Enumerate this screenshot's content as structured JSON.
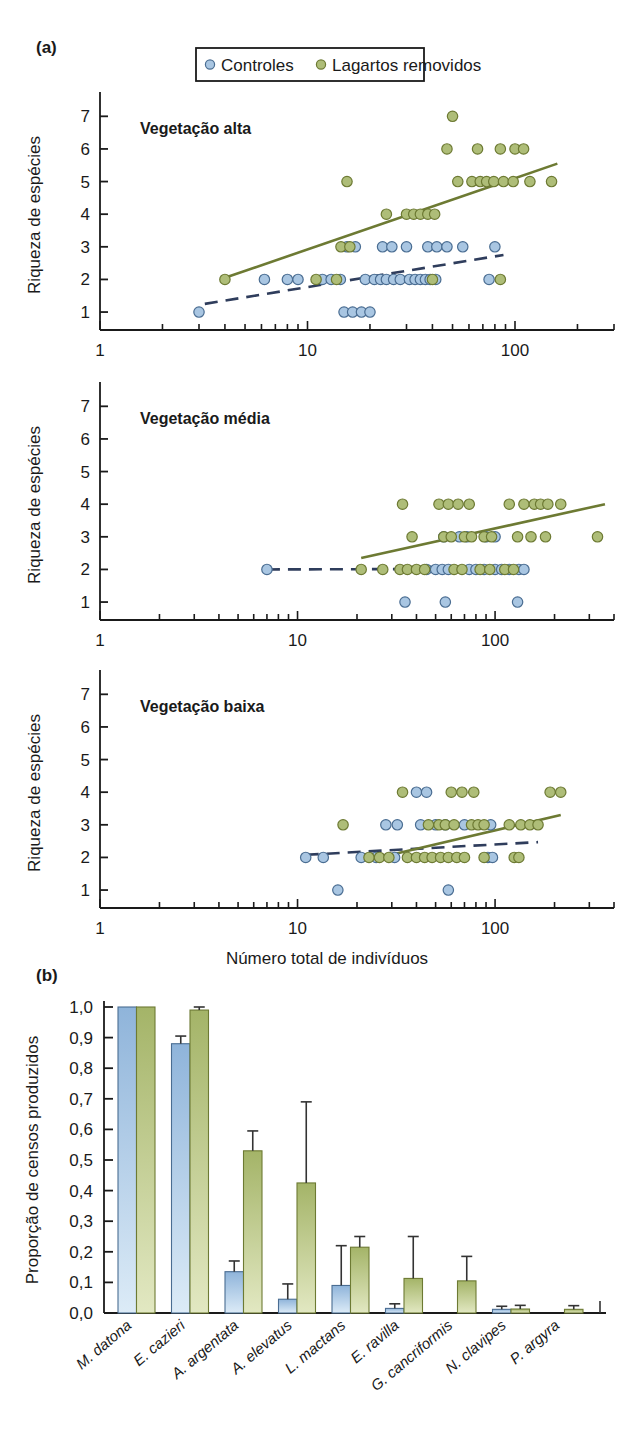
{
  "figure": {
    "panel_a_tag": "(a)",
    "panel_b_tag": "(b)"
  },
  "legend": {
    "items": [
      {
        "label": "Controles",
        "color": "#a9c6e2",
        "icon": "circle-marker-icon"
      },
      {
        "label": "Lagartos removidos",
        "color": "#aebd78",
        "icon": "circle-marker-icon"
      }
    ]
  },
  "colors": {
    "control_fill": "#a9c6e2",
    "control_stroke": "#4a6d92",
    "removed_fill": "#aebd78",
    "removed_stroke": "#6d7a33",
    "control_line": "#2f3d5c",
    "removed_line": "#6d7a33",
    "axis": "#1a1a1a",
    "bar_blue_top": "#8fb4da",
    "bar_blue_bottom": "#dbe9f6",
    "bar_green_top": "#a4b468",
    "bar_green_bottom": "#dfe6bf"
  },
  "chart_data": [
    {
      "type": "scatter",
      "id": "vegetacao-alta",
      "title": "Vegetação alta",
      "xlabel": "",
      "ylabel": "Riqueza de espécies",
      "xscale": "log",
      "xlim": [
        1,
        300
      ],
      "ylim": [
        0.45,
        7.5
      ],
      "xticks": [
        1,
        10,
        100
      ],
      "xticklabels": [
        "1",
        "10",
        "100"
      ],
      "yticks": [
        1,
        2,
        3,
        4,
        5,
        6,
        7
      ],
      "yticklabels": [
        "1",
        "2",
        "3",
        "4",
        "5",
        "6",
        "7"
      ],
      "grid": false,
      "series": [
        {
          "name": "Controles",
          "marker": "circle",
          "color": "#a9c6e2",
          "points": [
            [
              3.0,
              1
            ],
            [
              15.0,
              1
            ],
            [
              16.5,
              1
            ],
            [
              18.2,
              1
            ],
            [
              20.0,
              1
            ],
            [
              6.2,
              2
            ],
            [
              8.0,
              2
            ],
            [
              9.0,
              2
            ],
            [
              11.8,
              2
            ],
            [
              13.0,
              2
            ],
            [
              14.4,
              2
            ],
            [
              19.0,
              2
            ],
            [
              21.0,
              2
            ],
            [
              22.5,
              2
            ],
            [
              24.0,
              2
            ],
            [
              26.0,
              2
            ],
            [
              28.0,
              2
            ],
            [
              31.0,
              2
            ],
            [
              33.0,
              2
            ],
            [
              35.0,
              2
            ],
            [
              37.0,
              2
            ],
            [
              39.0,
              2
            ],
            [
              41.5,
              2
            ],
            [
              75.0,
              2
            ],
            [
              15.5,
              3
            ],
            [
              17.0,
              3
            ],
            [
              23.0,
              3
            ],
            [
              25.5,
              3
            ],
            [
              30.0,
              3
            ],
            [
              38.0,
              3
            ],
            [
              42.0,
              3
            ],
            [
              47.0,
              3
            ],
            [
              56.0,
              3
            ],
            [
              80.0,
              3
            ]
          ]
        },
        {
          "name": "Lagartos removidos",
          "marker": "circle",
          "color": "#aebd78",
          "points": [
            [
              4.0,
              2
            ],
            [
              11.0,
              2
            ],
            [
              13.8,
              2
            ],
            [
              40.0,
              2
            ],
            [
              85.0,
              2
            ],
            [
              14.5,
              3
            ],
            [
              16.0,
              3
            ],
            [
              24.0,
              4
            ],
            [
              30.0,
              4
            ],
            [
              32.5,
              4
            ],
            [
              35.0,
              4
            ],
            [
              38.0,
              4
            ],
            [
              41.0,
              4
            ],
            [
              15.5,
              5
            ],
            [
              53.0,
              5
            ],
            [
              62.0,
              5
            ],
            [
              68.0,
              5
            ],
            [
              73.0,
              5
            ],
            [
              79.0,
              5
            ],
            [
              88.0,
              5
            ],
            [
              98.0,
              5
            ],
            [
              118.0,
              5
            ],
            [
              150.0,
              5
            ],
            [
              47.0,
              6
            ],
            [
              66.0,
              6
            ],
            [
              85.0,
              6
            ],
            [
              100.0,
              6
            ],
            [
              110.0,
              6
            ],
            [
              50.0,
              7
            ]
          ]
        }
      ],
      "trendlines": [
        {
          "name": "Controles",
          "style": "dashed",
          "color": "#2f3d5c",
          "x1": 3.2,
          "y1": 1.25,
          "x2": 88.0,
          "y2": 2.75
        },
        {
          "name": "Lagartos removidos",
          "style": "solid",
          "color": "#6d7a33",
          "x1": 4.0,
          "y1": 2.05,
          "x2": 160.0,
          "y2": 5.55
        }
      ]
    },
    {
      "type": "scatter",
      "id": "vegetacao-media",
      "title": "Vegetação média",
      "xlabel": "",
      "ylabel": "Riqueza de espécies",
      "xscale": "log",
      "xlim": [
        1,
        400
      ],
      "ylim": [
        0.45,
        7.5
      ],
      "xticks": [
        1,
        10,
        100
      ],
      "xticklabels": [
        "1",
        "10",
        "100"
      ],
      "yticks": [
        1,
        2,
        3,
        4,
        5,
        6,
        7
      ],
      "yticklabels": [
        "1",
        "2",
        "3",
        "4",
        "5",
        "6",
        "7"
      ],
      "grid": false,
      "series": [
        {
          "name": "Controles",
          "marker": "circle",
          "color": "#a9c6e2",
          "points": [
            [
              35.0,
              1
            ],
            [
              56.0,
              1
            ],
            [
              130.0,
              1
            ],
            [
              7.0,
              2
            ],
            [
              45.0,
              2
            ],
            [
              50.0,
              2
            ],
            [
              54.0,
              2
            ],
            [
              58.0,
              2
            ],
            [
              74.0,
              2
            ],
            [
              80.0,
              2
            ],
            [
              88.0,
              2
            ],
            [
              100.0,
              2
            ],
            [
              108.0,
              2
            ],
            [
              118.0,
              2
            ],
            [
              132.0,
              2
            ],
            [
              140.0,
              2
            ],
            [
              55.0,
              3
            ],
            [
              66.0,
              3
            ],
            [
              72.0,
              3
            ],
            [
              90.0,
              3
            ],
            [
              100.0,
              3
            ]
          ]
        },
        {
          "name": "Lagartos removidos",
          "marker": "circle",
          "color": "#aebd78",
          "points": [
            [
              21.0,
              2
            ],
            [
              27.0,
              2
            ],
            [
              33.0,
              2
            ],
            [
              36.0,
              2
            ],
            [
              40.0,
              2
            ],
            [
              44.0,
              2
            ],
            [
              62.0,
              2
            ],
            [
              68.0,
              2
            ],
            [
              84.0,
              2
            ],
            [
              94.0,
              2
            ],
            [
              112.0,
              2
            ],
            [
              124.0,
              2
            ],
            [
              38.0,
              3
            ],
            [
              55.0,
              3
            ],
            [
              60.0,
              3
            ],
            [
              70.0,
              3
            ],
            [
              76.0,
              3
            ],
            [
              88.0,
              3
            ],
            [
              96.0,
              3
            ],
            [
              130.0,
              3
            ],
            [
              152.0,
              3
            ],
            [
              180.0,
              3
            ],
            [
              330.0,
              3
            ],
            [
              34.0,
              4
            ],
            [
              52.0,
              4
            ],
            [
              58.0,
              4
            ],
            [
              65.0,
              4
            ],
            [
              74.0,
              4
            ],
            [
              118.0,
              4
            ],
            [
              140.0,
              4
            ],
            [
              158.0,
              4
            ],
            [
              170.0,
              4
            ],
            [
              185.0,
              4
            ],
            [
              215.0,
              4
            ]
          ]
        }
      ],
      "trendlines": [
        {
          "name": "Controles",
          "style": "dashed",
          "color": "#2f3d5c",
          "x1": 7.0,
          "y1": 2.0,
          "x2": 140.0,
          "y2": 2.02
        },
        {
          "name": "Lagartos removidos",
          "style": "solid",
          "color": "#6d7a33",
          "x1": 21.0,
          "y1": 2.35,
          "x2": 360.0,
          "y2": 4.0
        }
      ]
    },
    {
      "type": "scatter",
      "id": "vegetacao-baixa",
      "title": "Vegetação baixa",
      "xlabel": "Número total de indivíduos",
      "ylabel": "Riqueza de espécies",
      "xscale": "log",
      "xlim": [
        1,
        400
      ],
      "ylim": [
        0.45,
        7.5
      ],
      "xticks": [
        1,
        10,
        100
      ],
      "xticklabels": [
        "1",
        "10",
        "100"
      ],
      "yticks": [
        1,
        2,
        3,
        4,
        5,
        6,
        7
      ],
      "yticklabels": [
        "1",
        "2",
        "3",
        "4",
        "5",
        "6",
        "7"
      ],
      "grid": false,
      "series": [
        {
          "name": "Controles",
          "marker": "circle",
          "color": "#a9c6e2",
          "points": [
            [
              16.0,
              1
            ],
            [
              58.0,
              1
            ],
            [
              11.0,
              2
            ],
            [
              13.5,
              2
            ],
            [
              21.0,
              2
            ],
            [
              25.0,
              2
            ],
            [
              31.0,
              2
            ],
            [
              92.0,
              2
            ],
            [
              97.0,
              2
            ],
            [
              28.0,
              3
            ],
            [
              32.0,
              3
            ],
            [
              42.0,
              3
            ],
            [
              50.0,
              3
            ],
            [
              56.0,
              3
            ],
            [
              70.0,
              3
            ],
            [
              95.0,
              3
            ],
            [
              40.0,
              4
            ],
            [
              45.0,
              4
            ]
          ]
        },
        {
          "name": "Lagartos removidos",
          "marker": "circle",
          "color": "#aebd78",
          "points": [
            [
              23.0,
              2
            ],
            [
              26.0,
              2
            ],
            [
              29.0,
              2
            ],
            [
              36.0,
              2
            ],
            [
              40.0,
              2
            ],
            [
              44.0,
              2
            ],
            [
              48.0,
              2
            ],
            [
              53.0,
              2
            ],
            [
              58.0,
              2
            ],
            [
              64.0,
              2
            ],
            [
              70.0,
              2
            ],
            [
              88.0,
              2
            ],
            [
              125.0,
              2
            ],
            [
              132.0,
              2
            ],
            [
              17.0,
              3
            ],
            [
              46.0,
              3
            ],
            [
              52.0,
              3
            ],
            [
              56.0,
              3
            ],
            [
              62.0,
              3
            ],
            [
              76.0,
              3
            ],
            [
              82.0,
              3
            ],
            [
              88.0,
              3
            ],
            [
              118.0,
              3
            ],
            [
              135.0,
              3
            ],
            [
              150.0,
              3
            ],
            [
              165.0,
              3
            ],
            [
              34.0,
              4
            ],
            [
              60.0,
              4
            ],
            [
              68.0,
              4
            ],
            [
              78.0,
              4
            ],
            [
              190.0,
              4
            ],
            [
              215.0,
              4
            ]
          ]
        }
      ],
      "trendlines": [
        {
          "name": "Controles",
          "style": "dashed",
          "color": "#2f3d5c",
          "x1": 11.0,
          "y1": 2.08,
          "x2": 165.0,
          "y2": 2.47
        },
        {
          "name": "Lagartos removidos",
          "style": "solid",
          "color": "#6d7a33",
          "x1": 26.0,
          "y1": 2.0,
          "x2": 215.0,
          "y2": 3.3
        }
      ]
    },
    {
      "type": "bar",
      "id": "proporcao-censos",
      "title": "",
      "xlabel": "",
      "ylabel": "Proporção de censos produzidos",
      "ylim": [
        0.0,
        1.0
      ],
      "yticks": [
        0.0,
        0.1,
        0.2,
        0.3,
        0.4,
        0.5,
        0.6,
        0.7,
        0.8,
        0.9,
        1.0
      ],
      "yticklabels": [
        "0,0",
        "0,1",
        "0,2",
        "0,3",
        "0,4",
        "0,5",
        "0,6",
        "0,7",
        "0,8",
        "0,9",
        "1,0"
      ],
      "grid": false,
      "categories": [
        "M. datona",
        "E. cazieri",
        "A. argentata",
        "A. elevatus",
        "L. mactans",
        "E. ravilla",
        "G. cancriformis",
        "N. clavipes",
        "P. argyra"
      ],
      "series": [
        {
          "name": "Controles",
          "color": "#a9c6e2",
          "values": [
            1.0,
            0.88,
            0.135,
            0.045,
            0.09,
            0.015,
            0.0,
            0.012,
            0.0
          ],
          "errors": [
            0.0,
            0.025,
            0.035,
            0.05,
            0.13,
            0.015,
            0.0,
            0.01,
            0.0
          ]
        },
        {
          "name": "Lagartos removidos",
          "color": "#aebd78",
          "values": [
            1.0,
            0.99,
            0.53,
            0.425,
            0.215,
            0.113,
            0.105,
            0.013,
            0.012
          ],
          "errors": [
            0.0,
            0.022,
            0.065,
            0.265,
            0.035,
            0.137,
            0.08,
            0.012,
            0.012
          ]
        }
      ]
    }
  ]
}
